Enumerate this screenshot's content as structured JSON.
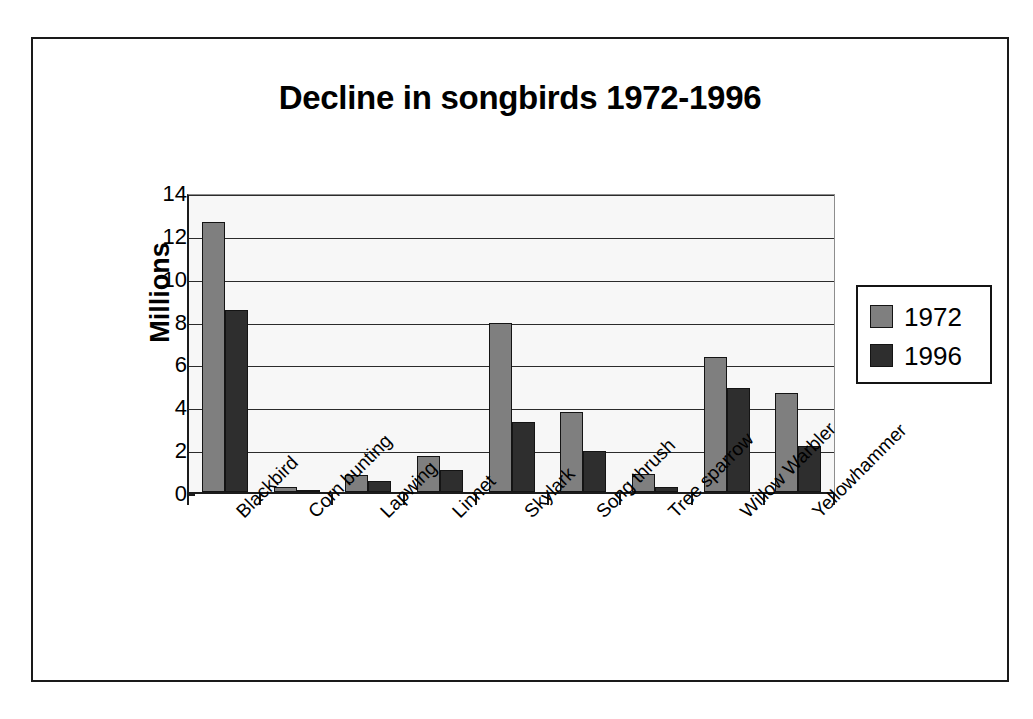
{
  "chart_data": {
    "type": "bar",
    "title": "Decline in songbirds 1972-1996",
    "xlabel": "",
    "ylabel": "Millions",
    "ylim": [
      0,
      14
    ],
    "yticks": [
      0,
      2,
      4,
      6,
      8,
      10,
      12,
      14
    ],
    "grid": true,
    "legend_position": "right",
    "categories": [
      "Blackbird",
      "Corn bunting",
      "Lapwing",
      "Linnet",
      "Skylark",
      "Song thrush",
      "Tree sparrow",
      "Willow Warbler",
      "Yellowhammer"
    ],
    "series": [
      {
        "name": "1972",
        "color": "#7f7f7f",
        "values": [
          12.6,
          0.25,
          0.8,
          1.7,
          7.9,
          3.75,
          0.85,
          6.3,
          4.6
        ]
      },
      {
        "name": "1996",
        "color": "#2e2e2e",
        "values": [
          8.5,
          0.05,
          0.5,
          1.05,
          3.25,
          1.9,
          0.25,
          4.85,
          2.15
        ]
      }
    ]
  },
  "legend": {
    "entries": [
      {
        "label": "1972",
        "color": "#7f7f7f"
      },
      {
        "label": "1996",
        "color": "#2e2e2e"
      }
    ]
  },
  "axis": {
    "y_tick_labels": [
      "14",
      "12",
      "10",
      "8",
      "6",
      "4",
      "2",
      "0"
    ]
  }
}
